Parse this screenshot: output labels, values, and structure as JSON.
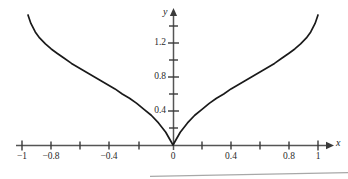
{
  "chart_data": {
    "type": "line",
    "title": "",
    "subtitle": "",
    "xlabel": "x",
    "ylabel": "y",
    "xlim": [
      -1.09,
      1.09
    ],
    "ylim": [
      -0.06,
      1.64
    ],
    "grid": false,
    "legend": null,
    "annotations": [],
    "x_ticks": [
      {
        "value": -1,
        "label": "−1",
        "major": true,
        "px": 22
      },
      {
        "value": -0.8,
        "label": "−0.8",
        "major": true,
        "px": 51
      },
      {
        "value": -0.6,
        "label": "",
        "major": false,
        "px": 80
      },
      {
        "value": -0.4,
        "label": "−0.4",
        "major": true,
        "px": 109
      },
      {
        "value": -0.2,
        "label": "",
        "major": false,
        "px": 139
      },
      {
        "value": 0,
        "label": "0",
        "major": true,
        "px": 173
      },
      {
        "value": 0.2,
        "label": "",
        "major": false,
        "px": 202
      },
      {
        "value": 0.4,
        "label": "0.4",
        "major": true,
        "px": 231
      },
      {
        "value": 0.6,
        "label": "",
        "major": false,
        "px": 260
      },
      {
        "value": 0.8,
        "label": "0.8",
        "major": true,
        "px": 289
      },
      {
        "value": 1,
        "label": "1",
        "major": true,
        "px": 318
      }
    ],
    "y_ticks": [
      {
        "value": 0.2,
        "label": "",
        "major": false,
        "px": 128
      },
      {
        "value": 0.4,
        "label": "0.4",
        "major": true,
        "px": 111
      },
      {
        "value": 0.6,
        "label": "",
        "major": false,
        "px": 94
      },
      {
        "value": 0.8,
        "label": "0.8",
        "major": true,
        "px": 77
      },
      {
        "value": 1.0,
        "label": "",
        "major": false,
        "px": 60
      },
      {
        "value": 1.2,
        "label": "1.2",
        "major": true,
        "px": 43
      },
      {
        "value": 1.4,
        "label": "",
        "major": false,
        "px": 26
      }
    ],
    "series": [
      {
        "name": "curve",
        "comment": "cusp curve, symmetric about the y-axis, V-shaped at the origin and steeply rising toward x = ±1",
        "x": [
          -1.0,
          -0.98,
          -0.95,
          -0.92,
          -0.88,
          -0.84,
          -0.8,
          -0.75,
          -0.7,
          -0.65,
          -0.6,
          -0.55,
          -0.5,
          -0.45,
          -0.4,
          -0.35,
          -0.3,
          -0.25,
          -0.2,
          -0.15,
          -0.1,
          -0.05,
          0.0,
          0.05,
          0.1,
          0.15,
          0.2,
          0.25,
          0.3,
          0.35,
          0.4,
          0.45,
          0.5,
          0.55,
          0.6,
          0.65,
          0.7,
          0.75,
          0.8,
          0.84,
          0.88,
          0.92,
          0.95,
          0.98,
          1.0
        ],
        "y": [
          1.53,
          1.43,
          1.33,
          1.26,
          1.19,
          1.13,
          1.08,
          1.02,
          0.96,
          0.91,
          0.86,
          0.81,
          0.76,
          0.71,
          0.66,
          0.6,
          0.55,
          0.49,
          0.42,
          0.35,
          0.26,
          0.15,
          0.0,
          0.15,
          0.26,
          0.35,
          0.42,
          0.49,
          0.55,
          0.6,
          0.66,
          0.71,
          0.76,
          0.81,
          0.86,
          0.91,
          0.96,
          1.02,
          1.08,
          1.13,
          1.19,
          1.26,
          1.33,
          1.43,
          1.53
        ]
      }
    ]
  },
  "style": {
    "curve_color": "#1a1a1a",
    "axis_color": "#4a4a4a",
    "tick_color": "#3a3a3a",
    "label_color": "#2b2b2b",
    "background": "#ffffff",
    "artifact_color": "#8a8a8a"
  },
  "axis_names": {
    "x": "x",
    "y": "y"
  }
}
